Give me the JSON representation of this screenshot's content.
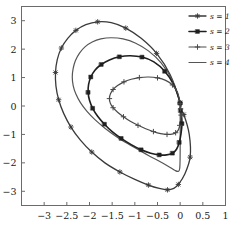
{
  "chart_data": {
    "type": "line",
    "title": "",
    "subtitle": "",
    "xlabel": "",
    "ylabel": "",
    "xlim": [
      -3.5,
      1.0
    ],
    "ylim": [
      -3.5,
      3.5
    ],
    "grid": false,
    "legend_position": "top-right",
    "x_ticks": [
      -3,
      -2.5,
      -2,
      -1.5,
      -1,
      -0.5,
      0,
      0.5,
      1
    ],
    "x_tick_labels": [
      "-3",
      "-2.5",
      "-2",
      "-1.5",
      "-1",
      "-0.5",
      "0",
      "0.5",
      "1"
    ],
    "y_ticks": [
      -3,
      -2,
      -1,
      0,
      1,
      2,
      3
    ],
    "y_tick_labels": [
      "-3",
      "-2",
      "-1",
      "0",
      "1",
      "2",
      "3"
    ],
    "series": [
      {
        "name": "s = 1",
        "marker": "star",
        "color": "#3a3a3a",
        "linewidth": 1.3,
        "x": [
          0.0,
          -0.22,
          -0.52,
          -0.86,
          -1.2,
          -1.52,
          -1.82,
          -2.08,
          -2.3,
          -2.48,
          -2.62,
          -2.71,
          -2.75,
          -2.74,
          -2.68,
          -2.57,
          -2.41,
          -2.2,
          -1.95,
          -1.66,
          -1.33,
          -1.0,
          -0.7,
          -0.46,
          -0.28,
          -0.14,
          -0.04,
          0.1,
          0.22,
          0.2,
          0.08,
          0.0
        ],
        "y": [
          0.12,
          1.1,
          1.85,
          2.38,
          2.74,
          2.93,
          2.96,
          2.86,
          2.66,
          2.38,
          2.04,
          1.64,
          1.18,
          0.7,
          0.22,
          -0.26,
          -0.74,
          -1.2,
          -1.62,
          -2.0,
          -2.32,
          -2.58,
          -2.78,
          -2.9,
          -2.95,
          -2.9,
          -2.76,
          -2.4,
          -1.8,
          -1.0,
          -0.3,
          -0.12
        ]
      },
      {
        "name": "s = 2",
        "marker": "square",
        "color": "#1f1f1f",
        "linewidth": 1.6,
        "x": [
          0.0,
          -0.14,
          -0.34,
          -0.58,
          -0.84,
          -1.1,
          -1.34,
          -1.56,
          -1.74,
          -1.88,
          -1.97,
          -2.02,
          -2.03,
          -2.0,
          -1.93,
          -1.82,
          -1.67,
          -1.5,
          -1.3,
          -1.08,
          -0.86,
          -0.65,
          -0.46,
          -0.3,
          -0.17,
          -0.08,
          -0.02,
          0.02,
          0.04,
          0.03,
          0.01,
          0.0
        ],
        "y": [
          0.1,
          0.74,
          1.22,
          1.55,
          1.72,
          1.77,
          1.73,
          1.62,
          1.46,
          1.26,
          1.02,
          0.76,
          0.48,
          0.2,
          -0.08,
          -0.36,
          -0.64,
          -0.9,
          -1.14,
          -1.36,
          -1.54,
          -1.66,
          -1.72,
          -1.72,
          -1.66,
          -1.52,
          -1.28,
          -0.96,
          -0.62,
          -0.34,
          -0.16,
          -0.1
        ]
      },
      {
        "name": "s = 3",
        "marker": "plus",
        "color": "#4a4a4a",
        "linewidth": 1.2,
        "x": [
          0.0,
          -0.06,
          -0.17,
          -0.32,
          -0.5,
          -0.7,
          -0.9,
          -1.08,
          -1.24,
          -1.38,
          -1.48,
          -1.54,
          -1.56,
          -1.54,
          -1.48,
          -1.38,
          -1.25,
          -1.1,
          -0.93,
          -0.76,
          -0.59,
          -0.43,
          -0.29,
          -0.18,
          -0.1,
          -0.04,
          -0.01,
          0.01,
          0.02,
          0.02,
          0.01,
          0.0
        ],
        "y": [
          0.08,
          0.48,
          0.74,
          0.9,
          0.99,
          1.02,
          1.0,
          0.94,
          0.85,
          0.72,
          0.58,
          0.42,
          0.26,
          0.1,
          -0.06,
          -0.22,
          -0.38,
          -0.54,
          -0.68,
          -0.8,
          -0.9,
          -0.97,
          -1.0,
          -0.99,
          -0.94,
          -0.84,
          -0.68,
          -0.5,
          -0.32,
          -0.18,
          -0.1,
          -0.08
        ]
      },
      {
        "name": "s = 4",
        "marker": "none",
        "color": "#555555",
        "linewidth": 1.2,
        "x": [
          0.0,
          -0.18,
          -0.42,
          -0.7,
          -0.98,
          -1.26,
          -1.52,
          -1.75,
          -1.94,
          -2.1,
          -2.22,
          -2.31,
          -2.36,
          -2.38,
          -2.36,
          -2.3,
          -2.2,
          -2.06,
          -1.88,
          -1.66,
          -1.42,
          -1.16,
          -0.92,
          -0.7,
          -0.51,
          -0.35,
          -0.22,
          -0.12,
          -0.05,
          -0.01,
          0.0,
          0.0
        ],
        "y": [
          0.1,
          0.92,
          1.52,
          1.94,
          2.21,
          2.36,
          2.4,
          2.36,
          2.25,
          2.08,
          1.86,
          1.6,
          1.32,
          1.02,
          0.72,
          0.42,
          0.12,
          -0.18,
          -0.48,
          -0.78,
          -1.06,
          -1.32,
          -1.54,
          -1.74,
          -1.9,
          -2.04,
          -2.16,
          -2.26,
          -2.3,
          -2.2,
          -1.6,
          -0.1
        ]
      }
    ]
  },
  "legend": {
    "entries": [
      {
        "label": "s = 1",
        "marker": "star"
      },
      {
        "label": "s = 2",
        "marker": "square"
      },
      {
        "label": "s = 3",
        "marker": "plus"
      },
      {
        "label": "s = 4",
        "marker": "none"
      }
    ]
  }
}
